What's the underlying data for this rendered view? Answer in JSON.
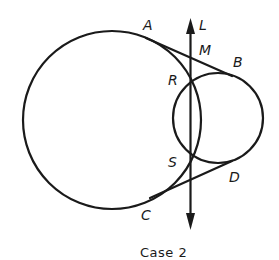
{
  "figure": {
    "caption": "Case 2",
    "stroke_color": "#1a1a1a",
    "background": "#ffffff"
  },
  "circles": [
    {
      "name": "large-circle",
      "cx": 112,
      "cy": 120,
      "r": 89
    },
    {
      "name": "small-circle",
      "cx": 218,
      "cy": 118,
      "r": 45
    }
  ],
  "tangents": [
    {
      "name": "tangent-AB",
      "from": "A",
      "to": "B"
    },
    {
      "name": "tangent-CD",
      "from": "C",
      "to": "D"
    }
  ],
  "line": {
    "name": "L",
    "direction": "vertical, arrows at both ends"
  },
  "labels": {
    "A": "A",
    "B": "B",
    "C": "C",
    "D": "D",
    "L": "L",
    "M": "M",
    "R": "R",
    "S": "S"
  }
}
